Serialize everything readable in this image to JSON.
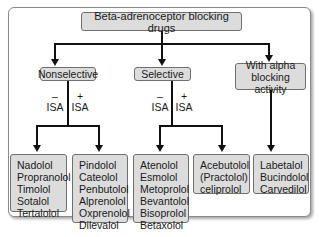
{
  "diagram": {
    "title": "Beta-adrenoceptor blocking drugs",
    "categories": [
      {
        "label": "Nonselective"
      },
      {
        "label": "Selective"
      },
      {
        "label": "With alpha blocking activity"
      }
    ],
    "isa_labels": {
      "minus_sign": "–",
      "plus_sign": "+",
      "isa": "ISA"
    },
    "groups": {
      "nonselective_minus_isa": [
        "Nadolol",
        "Propranolol",
        "Timolol",
        "Sotalol",
        "Tertalolol"
      ],
      "nonselective_plus_isa": [
        "Pindolol",
        "Cateolol",
        "Penbutolol",
        "Alprenolol",
        "Oxprenolol",
        "Dilevalol"
      ],
      "selective_minus_isa": [
        "Atenolol",
        "Esmolol",
        "Metoprolol",
        "Bevantolol",
        "Bisoprolol",
        "Betaxolol"
      ],
      "selective_plus_isa": [
        "Acebutolol",
        "(Practolol)",
        "celiprolol"
      ],
      "alpha_blocking": [
        "Labetalol",
        "Bucindolol",
        "Carvedilol"
      ]
    }
  }
}
